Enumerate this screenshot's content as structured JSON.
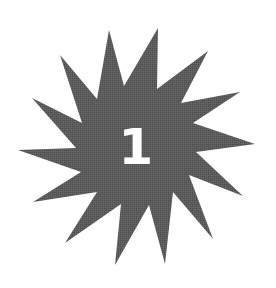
{
  "badge": {
    "number": "1",
    "shape": "star-burst-icon",
    "points": 14,
    "fill_color": "#5a5a5a",
    "text_color": "#ffffff",
    "background_color": "#ffffff"
  }
}
